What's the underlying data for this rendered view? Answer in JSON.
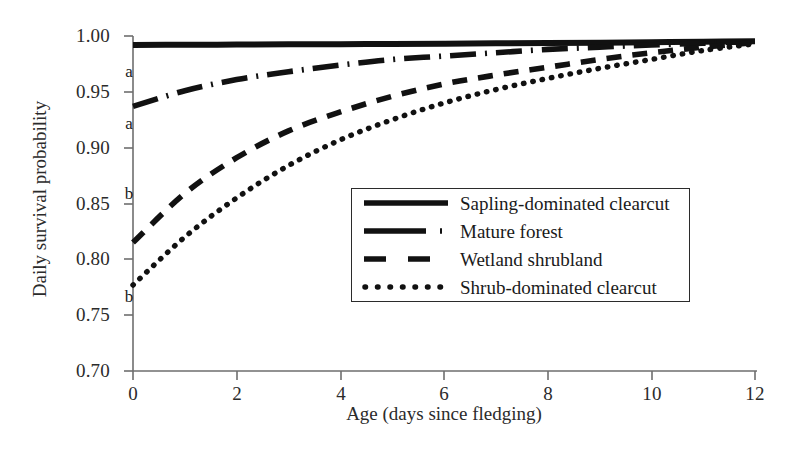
{
  "chart_data": {
    "type": "line",
    "title": "",
    "xlabel": "Age (days since fledging)",
    "ylabel": "Daily survival probability",
    "xlim": [
      0,
      12
    ],
    "ylim": [
      0.7,
      1.0
    ],
    "xticks": [
      "0",
      "2",
      "4",
      "6",
      "8",
      "10",
      "12"
    ],
    "yticks": [
      "0.70",
      "0.75",
      "0.80",
      "0.85",
      "0.90",
      "0.95",
      "1.00"
    ],
    "grid": false,
    "legend_position": "center-right-inside",
    "x": [
      0,
      1,
      2,
      3,
      4,
      5,
      6,
      7,
      8,
      9,
      10,
      11,
      12
    ],
    "series": [
      {
        "name": "Sapling-dominated clearcut",
        "style": "solid",
        "group_label": "a",
        "values": [
          0.992,
          0.9921,
          0.9923,
          0.9925,
          0.9927,
          0.9929,
          0.9931,
          0.9934,
          0.9937,
          0.994,
          0.9944,
          0.9948,
          0.9953
        ]
      },
      {
        "name": "Mature forest",
        "style": "long-dash-dot",
        "group_label": "a",
        "values": [
          0.937,
          0.951,
          0.961,
          0.968,
          0.974,
          0.979,
          0.982,
          0.985,
          0.988,
          0.99,
          0.992,
          0.9935,
          0.995
        ]
      },
      {
        "name": "Wetland shrubland",
        "style": "dashed",
        "group_label": "b",
        "values": [
          0.815,
          0.859,
          0.891,
          0.915,
          0.932,
          0.946,
          0.957,
          0.965,
          0.972,
          0.979,
          0.985,
          0.99,
          0.994
        ]
      },
      {
        "name": "Shrub-dominated clearcut",
        "style": "dotted",
        "group_label": "b",
        "values": [
          0.777,
          0.82,
          0.855,
          0.884,
          0.907,
          0.925,
          0.94,
          0.952,
          0.962,
          0.971,
          0.979,
          0.987,
          0.993
        ]
      }
    ],
    "annotations": [
      {
        "text": "a",
        "x_px": 128,
        "y_px": 62,
        "note": "label for sapling-dominated clearcut curve"
      },
      {
        "text": "a",
        "x_px": 128,
        "y_px": 114,
        "note": "label for mature forest curve"
      },
      {
        "text": "b",
        "x_px": 128,
        "y_px": 184,
        "note": "label for wetland shrubland curve"
      },
      {
        "text": "b",
        "x_px": 128,
        "y_px": 287,
        "note": "label for shrub-dominated clearcut curve"
      }
    ]
  },
  "axes": {
    "x_title": "Age (days since fledging)",
    "y_title": "Daily survival probability",
    "x_tick_labels": [
      "0",
      "2",
      "4",
      "6",
      "8",
      "10",
      "12"
    ],
    "y_tick_labels": [
      "1.00",
      "0.95",
      "0.90",
      "0.85",
      "0.80",
      "0.75",
      "0.70"
    ]
  },
  "legend": {
    "items": [
      {
        "label": "Sapling-dominated clearcut",
        "style": "solid"
      },
      {
        "label": "Mature forest",
        "style": "long-dash-dot"
      },
      {
        "label": "Wetland shrubland",
        "style": "dashed"
      },
      {
        "label": "Shrub-dominated clearcut",
        "style": "dotted"
      }
    ]
  },
  "colors": {
    "line": "#111111",
    "axis": "#6e6e6e",
    "text": "#1f1f1f",
    "background": "#ffffff"
  }
}
